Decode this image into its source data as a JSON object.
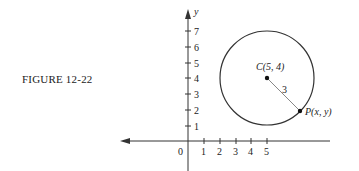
{
  "figure": {
    "caption": "FIGURE 12-22"
  },
  "axes": {
    "y_label": "y",
    "origin_label": "0",
    "x_ticks": [
      "1",
      "2",
      "3",
      "4",
      "5"
    ],
    "y_ticks": [
      "1",
      "2",
      "3",
      "4",
      "5",
      "6",
      "7"
    ]
  },
  "circle": {
    "center_label": "C(5, 4)",
    "point_label": "P(x, y)",
    "radius_label": "3"
  },
  "colors": {
    "ink": "#333333",
    "radius_line": "#888888"
  }
}
